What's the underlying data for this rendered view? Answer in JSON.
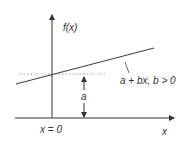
{
  "diagram": {
    "labels": {
      "y_axis": "f(x)",
      "x_axis": "x",
      "origin": "x = 0",
      "intercept": "a",
      "line": "a + bx, b > 0"
    },
    "colors": {
      "axis": "#333333",
      "line": "#444444",
      "dotted": "#888888",
      "text": "#333333"
    }
  }
}
